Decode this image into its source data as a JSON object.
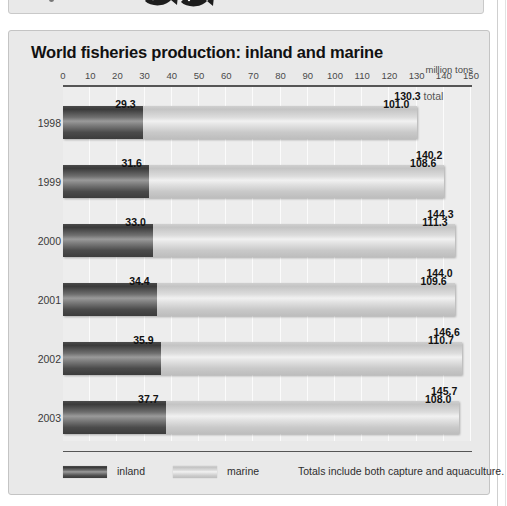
{
  "panel": {
    "title": "World fisheries production: inland and marine",
    "units": "million tons"
  },
  "legend": {
    "inland_label": "inland",
    "marine_label": "marine",
    "note": "Totals include both capture and aquaculture."
  },
  "axis": {
    "ticks": [
      "0",
      "10",
      "20",
      "30",
      "40",
      "50",
      "60",
      "70",
      "80",
      "90",
      "100",
      "110",
      "120",
      "130",
      "140",
      "150"
    ]
  },
  "rows": [
    {
      "year": "1998",
      "inland": "29.3",
      "marine": "101.0",
      "total": "130.3",
      "total_suffix": " total"
    },
    {
      "year": "1999",
      "inland": "31.6",
      "marine": "108.6",
      "total": "140.2",
      "total_suffix": ""
    },
    {
      "year": "2000",
      "inland": "33.0",
      "marine": "111.3",
      "total": "144.3",
      "total_suffix": ""
    },
    {
      "year": "2001",
      "inland": "34.4",
      "marine": "109.6",
      "total": "144.0",
      "total_suffix": ""
    },
    {
      "year": "2002",
      "inland": "35.9",
      "marine": "110.7",
      "total": "146.6",
      "total_suffix": ""
    },
    {
      "year": "2003",
      "inland": "37.7",
      "marine": "108.0",
      "total": "145.7",
      "total_suffix": ""
    }
  ],
  "chart_data": {
    "type": "bar",
    "title": "World fisheries production: inland and marine",
    "subtitle": "",
    "orientation": "horizontal",
    "stacked": true,
    "xlabel": "million tons",
    "ylabel": "",
    "xlim": [
      0,
      150
    ],
    "xticks": [
      0,
      10,
      20,
      30,
      40,
      50,
      60,
      70,
      80,
      90,
      100,
      110,
      120,
      130,
      140,
      150
    ],
    "grid": true,
    "legend_position": "bottom-left",
    "categories": [
      "1998",
      "1999",
      "2000",
      "2001",
      "2002",
      "2003"
    ],
    "series": [
      {
        "name": "inland",
        "values": [
          29.3,
          31.6,
          33.0,
          34.4,
          35.9,
          37.7
        ]
      },
      {
        "name": "marine",
        "values": [
          101.0,
          108.6,
          111.3,
          109.6,
          110.7,
          108.0
        ]
      }
    ],
    "totals": [
      130.3,
      140.2,
      144.3,
      144.0,
      146.6,
      145.7
    ],
    "annotations": [
      "130.3 total",
      "Totals include both capture and aquaculture."
    ]
  }
}
